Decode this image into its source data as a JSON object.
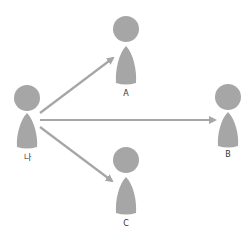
{
  "diagram": {
    "colors": {
      "person": "#a6a6a6",
      "arrow": "#a6a6a6",
      "label": "#333333",
      "background": "#ffffff"
    },
    "nodes": [
      {
        "id": "me",
        "label": "나",
        "x": 27,
        "head_y": 98,
        "label_y": 154
      },
      {
        "id": "a",
        "label": "A",
        "x": 126,
        "head_y": 29,
        "label_y": 92
      },
      {
        "id": "b",
        "label": "B",
        "x": 228,
        "head_y": 97,
        "label_y": 153
      },
      {
        "id": "c",
        "label": "C",
        "x": 126,
        "head_y": 160,
        "label_y": 222
      }
    ],
    "edges": [
      {
        "from": "나",
        "to": "A"
      },
      {
        "from": "나",
        "to": "B"
      },
      {
        "from": "나",
        "to": "C"
      }
    ]
  }
}
